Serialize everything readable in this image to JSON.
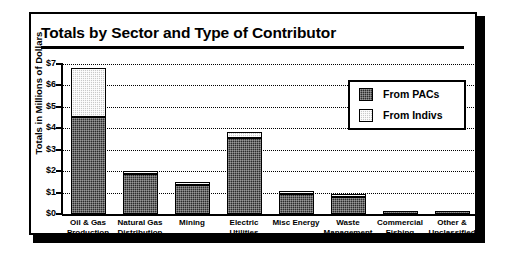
{
  "chart_data": {
    "type": "bar",
    "title": "Totals by Sector and Type of Contributor",
    "xlabel": "",
    "ylabel": "Totals in Millions of Dollars",
    "ylim": [
      0,
      7
    ],
    "ytick_values": [
      0,
      1,
      2,
      3,
      4,
      5,
      6,
      7
    ],
    "ytick_labels": [
      "$0",
      "$1",
      "$2",
      "$3",
      "$4",
      "$5",
      "$6",
      "$7"
    ],
    "grid": true,
    "stacked": true,
    "legend_position": "inside-upper-right",
    "categories": [
      "Oil & Gas Production",
      "Natural Gas Distribution",
      "Mining",
      "Electric Utilities",
      "Misc Energy",
      "Waste Management",
      "Commercial Fishing",
      "Other & Unclassified"
    ],
    "category_lines": [
      [
        "Oil & Gas",
        "Production"
      ],
      [
        "Natural Gas",
        "Distribution"
      ],
      [
        "Mining",
        ""
      ],
      [
        "Electric",
        "Utilities"
      ],
      [
        "Misc Energy",
        ""
      ],
      [
        "Waste",
        "Management"
      ],
      [
        "Commercial",
        "Fishing"
      ],
      [
        "Other &",
        "Unclassified"
      ]
    ],
    "series": [
      {
        "name": "From PACs",
        "color": "#2b2b2b",
        "values": [
          4.55,
          1.85,
          1.35,
          3.55,
          0.95,
          0.8,
          0.1,
          0.1
        ]
      },
      {
        "name": "From Indivs",
        "color": "#c9c9c9",
        "values": [
          2.25,
          0.05,
          0.05,
          0.3,
          0.05,
          0.05,
          0.0,
          0.0
        ]
      }
    ],
    "totals": [
      6.8,
      1.9,
      1.4,
      3.85,
      1.0,
      0.85,
      0.1,
      0.1
    ]
  },
  "legend": {
    "items": [
      {
        "label": "From PACs",
        "swatch": "dark-checker-swatch"
      },
      {
        "label": "From Indivs",
        "swatch": "light-checker-swatch"
      }
    ]
  }
}
